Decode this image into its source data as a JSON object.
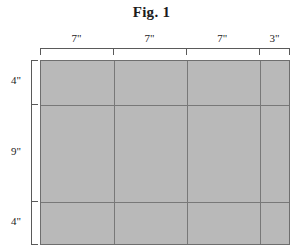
{
  "figure": {
    "title": "Fig. 1",
    "unit_symbol": "\"",
    "fill_color": "#b9b9b9",
    "line_color": "#787878",
    "border_color": "#6e6e6e",
    "dimension_color": "#5a5a5a",
    "background_color": "#ffffff"
  },
  "top_dimensions": {
    "labels": [
      {
        "text": "7\"",
        "value": 7
      },
      {
        "text": "7\"",
        "value": 7
      },
      {
        "text": "7\"",
        "value": 7
      },
      {
        "text": "3\"",
        "value": 3
      }
    ],
    "total": 24
  },
  "left_dimensions": {
    "labels": [
      {
        "text": "4\"",
        "value": 4
      },
      {
        "text": "9\"",
        "value": 9
      },
      {
        "text": "4\"",
        "value": 4
      }
    ],
    "total": 17
  },
  "chart_data": {
    "type": "table",
    "title": "Fig. 1",
    "xlabel": "",
    "ylabel": "",
    "categories": [
      "7\"",
      "7\"",
      "7\"",
      "3\""
    ],
    "column_widths_inches": [
      7,
      7,
      7,
      3
    ],
    "row_heights_inches": [
      4,
      9,
      4
    ],
    "total_width_inches": 24,
    "total_height_inches": 17,
    "grid": true,
    "legend": "none",
    "cells": [
      [
        "",
        "",
        "",
        ""
      ],
      [
        "",
        "",
        "",
        ""
      ],
      [
        "",
        "",
        "",
        ""
      ]
    ]
  }
}
